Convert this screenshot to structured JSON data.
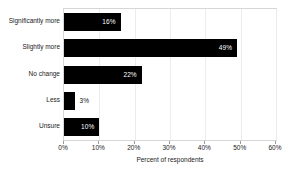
{
  "chart_data": {
    "type": "bar",
    "orientation": "horizontal",
    "title": "",
    "subtitle": "",
    "categories": [
      "Significantly more",
      "Slightly more",
      "No change",
      "Less",
      "Unsure"
    ],
    "values": [
      16,
      49,
      22,
      3,
      10
    ],
    "data_labels": [
      "16%",
      "49%",
      "22%",
      "3%",
      "10%"
    ],
    "xlabel": "Percent of respondents",
    "ylabel": "",
    "xlim": [
      0,
      60
    ],
    "xticks": [
      0,
      10,
      20,
      30,
      40,
      50,
      60
    ],
    "xtick_labels": [
      "0%",
      "10%",
      "20%",
      "30%",
      "40%",
      "50%",
      "60%"
    ],
    "grid": true,
    "grid_axis": "x",
    "legend": false,
    "bar_color": "#000000",
    "label_color_inside": "#ffffff",
    "label_color_outside": "#111111",
    "plot_border_color": "#d6d6d6",
    "gridline_color": "#ececec",
    "background_color": "#ffffff"
  }
}
